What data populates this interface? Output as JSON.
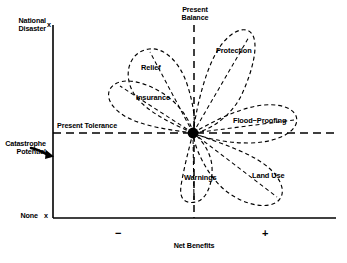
{
  "figure": {
    "background_color": "#ffffff",
    "ink_color": "#000000"
  },
  "axes": {
    "y": {
      "label": "Catastrophe\nPotential",
      "top_label": "National\nDisaster",
      "bottom_label": "None",
      "top_tick_mark": "x",
      "bottom_tick_mark": "x"
    },
    "x": {
      "label": "Net Benefits",
      "negative_sign": "−",
      "positive_sign": "+"
    }
  },
  "reference_lines": [
    {
      "name": "present-tolerance",
      "label": "Present Tolerance",
      "orientation": "horizontal",
      "style": "dashed"
    },
    {
      "name": "present-balance",
      "label": "Present\nBalance",
      "orientation": "vertical",
      "style": "dashed"
    }
  ],
  "annotations": [
    {
      "name": "catastrophe-potential-arrow",
      "label": "Catastrophe\nPotential"
    }
  ],
  "chart_data": {
    "type": "scatter",
    "xlabel": "Net Benefits",
    "ylabel": "Catastrophe Potential",
    "origin_marker": "filled-circle",
    "petals": [
      {
        "name": "relief",
        "label": "Relief",
        "direction": "upper-left"
      },
      {
        "name": "insurance",
        "label": "Insurance",
        "direction": "left"
      },
      {
        "name": "protection",
        "label": "Protection",
        "direction": "upper-right"
      },
      {
        "name": "flood-proofing",
        "label": "Flood−Proofing",
        "direction": "right"
      },
      {
        "name": "land-use",
        "label": "Land Use",
        "direction": "lower-right"
      },
      {
        "name": "warnings",
        "label": "Warnings",
        "direction": "down"
      }
    ]
  }
}
